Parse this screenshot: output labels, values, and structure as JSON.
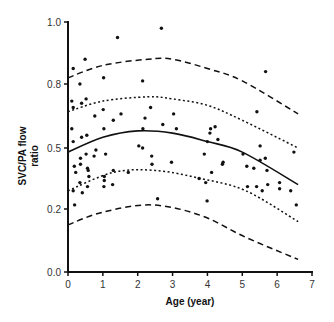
{
  "chart_data": {
    "type": "scatter",
    "title": "",
    "xlabel": "Age (year)",
    "ylabel_lines": [
      "SVC/PA flow",
      "ratio"
    ],
    "ylabel": "SVC/PA flow ratio",
    "xlim": [
      0,
      7
    ],
    "ylim": [
      0.0,
      1.0
    ],
    "x_ticks": [
      0,
      1,
      2,
      3,
      4,
      5,
      6,
      7
    ],
    "x_tick_labels": [
      "0",
      "1",
      "2",
      "3",
      "4",
      "5",
      "6",
      "7"
    ],
    "y_ticks": [
      0.0,
      0.2,
      0.5,
      0.8,
      1.0
    ],
    "y_tick_labels": [
      "0.0",
      "0.2",
      "0.5",
      "0.8",
      "1.0"
    ],
    "y_ticks_equally_spaced": true,
    "grid": false,
    "legend": null,
    "series": [
      {
        "name": "observations",
        "kind": "scatter",
        "points": [
          [
            1.42,
            0.95
          ],
          [
            2.68,
            0.98
          ],
          [
            0.49,
            0.88
          ],
          [
            0.15,
            0.85
          ],
          [
            1.02,
            0.82
          ],
          [
            0.34,
            0.8
          ],
          [
            2.14,
            0.81
          ],
          [
            5.67,
            0.84
          ],
          [
            0.11,
            0.72
          ],
          [
            0.39,
            0.71
          ],
          [
            0.52,
            0.73
          ],
          [
            0.15,
            0.69
          ],
          [
            1.01,
            0.68
          ],
          [
            0.77,
            0.65
          ],
          [
            1.3,
            0.63
          ],
          [
            1.52,
            0.66
          ],
          [
            0.11,
            0.59
          ],
          [
            1.03,
            0.59
          ],
          [
            0.54,
            0.56
          ],
          [
            0.39,
            0.55
          ],
          [
            0.15,
            0.53
          ],
          [
            2.03,
            0.51
          ],
          [
            2.14,
            0.5
          ],
          [
            0.8,
            0.49
          ],
          [
            0.52,
            0.47
          ],
          [
            0.75,
            0.46
          ],
          [
            1.08,
            0.47
          ],
          [
            0.36,
            0.45
          ],
          [
            0.36,
            0.42
          ],
          [
            0.18,
            0.41
          ],
          [
            0.56,
            0.4
          ],
          [
            0.22,
            0.38
          ],
          [
            0.58,
            0.39
          ],
          [
            1.3,
            0.39
          ],
          [
            1.73,
            0.38
          ],
          [
            1.04,
            0.36
          ],
          [
            0.6,
            0.36
          ],
          [
            1.04,
            0.34
          ],
          [
            0.34,
            0.33
          ],
          [
            1.28,
            0.32
          ],
          [
            0.15,
            0.29
          ],
          [
            0.41,
            0.28
          ],
          [
            0.56,
            0.31
          ],
          [
            1.03,
            0.31
          ],
          [
            0.19,
            0.22
          ],
          [
            2.57,
            0.25
          ],
          [
            2.37,
            0.69
          ],
          [
            2.21,
            0.64
          ],
          [
            3.03,
            0.66
          ],
          [
            2.72,
            0.61
          ],
          [
            2.15,
            0.59
          ],
          [
            3.11,
            0.59
          ],
          [
            4.09,
            0.59
          ],
          [
            4.22,
            0.6
          ],
          [
            4.07,
            0.57
          ],
          [
            4.3,
            0.54
          ],
          [
            4.0,
            0.53
          ],
          [
            2.4,
            0.46
          ],
          [
            3.91,
            0.47
          ],
          [
            4.45,
            0.43
          ],
          [
            4.43,
            0.42
          ],
          [
            2.41,
            0.42
          ],
          [
            2.97,
            0.43
          ],
          [
            4.12,
            0.38
          ],
          [
            3.76,
            0.35
          ],
          [
            3.95,
            0.33
          ],
          [
            5.42,
            0.67
          ],
          [
            5.51,
            0.51
          ],
          [
            6.48,
            0.48
          ],
          [
            5.02,
            0.47
          ],
          [
            5.51,
            0.44
          ],
          [
            5.66,
            0.45
          ],
          [
            5.13,
            0.41
          ],
          [
            5.33,
            0.4
          ],
          [
            5.71,
            0.39
          ],
          [
            6.07,
            0.33
          ],
          [
            5.73,
            0.32
          ],
          [
            5.15,
            0.31
          ],
          [
            5.41,
            0.31
          ],
          [
            5.57,
            0.29
          ],
          [
            6.07,
            0.3
          ],
          [
            6.39,
            0.29
          ],
          [
            3.99,
            0.24
          ],
          [
            6.55,
            0.22
          ]
        ]
      },
      {
        "name": "mean (regression)",
        "kind": "line",
        "style": "solid",
        "x": [
          0,
          1,
          2,
          3,
          4,
          5,
          6.6
        ],
        "y": [
          0.48,
          0.55,
          0.58,
          0.57,
          0.53,
          0.48,
          0.32
        ]
      },
      {
        "name": "upper inner band",
        "kind": "line",
        "style": "dotted",
        "x": [
          0,
          1,
          2.3,
          3,
          4,
          5,
          6.6
        ],
        "y": [
          0.67,
          0.72,
          0.74,
          0.73,
          0.7,
          0.63,
          0.5
        ]
      },
      {
        "name": "upper outer band",
        "kind": "line",
        "style": "dashed",
        "x": [
          0,
          1,
          2.3,
          3,
          4,
          5,
          6.6
        ],
        "y": [
          0.82,
          0.86,
          0.88,
          0.88,
          0.85,
          0.81,
          0.66
        ]
      },
      {
        "name": "lower inner band",
        "kind": "line",
        "style": "dotted",
        "x": [
          0,
          1.3,
          2.5,
          3.8,
          5.1,
          6.6
        ],
        "y": [
          0.29,
          0.38,
          0.39,
          0.35,
          0.29,
          0.16
        ]
      },
      {
        "name": "lower outer band",
        "kind": "line",
        "style": "dashed",
        "x": [
          0,
          1,
          2.4,
          3.8,
          5.1,
          6.6
        ],
        "y": [
          0.15,
          0.19,
          0.22,
          0.18,
          0.11,
          0.04
        ]
      }
    ]
  },
  "layout": {
    "plot_left_px": 68,
    "plot_right_px": 312,
    "y_tick_px": [
      272,
      209,
      148,
      84,
      22
    ],
    "colors": {
      "ink": "#111111",
      "label": "#333333",
      "background": "#ffffff"
    }
  }
}
